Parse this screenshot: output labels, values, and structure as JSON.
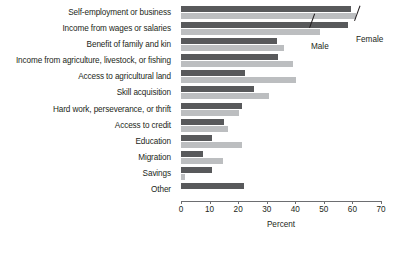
{
  "chart_data": {
    "type": "bar",
    "orientation": "horizontal",
    "title": "",
    "xlabel": "Percent",
    "ylabel": "",
    "xlim": [
      0,
      70
    ],
    "xticks": [
      0,
      10,
      20,
      30,
      40,
      50,
      60,
      70
    ],
    "xtick_labels": [
      "0",
      "10",
      "20",
      "30",
      "40",
      "50",
      "60",
      "70"
    ],
    "grid": false,
    "legend_position": "callout-annotations",
    "categories": [
      "Self-employment or business",
      "Income from wages or salaries",
      "Benefit of family and kin",
      "Income from agriculture, livestock, or fishing",
      "Access to agricultural land",
      "Skill acquisition",
      "Hard work, perseverance, or thrift",
      "Access to credit",
      "Education",
      "Migration",
      "Savings",
      "Other"
    ],
    "series": [
      {
        "name": "Male",
        "color": "#58595b",
        "values": [
          59.4,
          58.4,
          33.6,
          34.0,
          22.4,
          25.6,
          21.2,
          15.1,
          10.8,
          7.7,
          10.7,
          22.0
        ]
      },
      {
        "name": "Female",
        "color": "#bcbec0",
        "values": [
          61.2,
          48.6,
          36.1,
          39.2,
          40.3,
          30.8,
          20.3,
          16.4,
          21.2,
          14.6,
          1.4,
          0.0
        ]
      }
    ]
  },
  "legend": {
    "male_label": "Male",
    "female_label": "Female"
  },
  "axis": {
    "x_title": "Percent"
  }
}
